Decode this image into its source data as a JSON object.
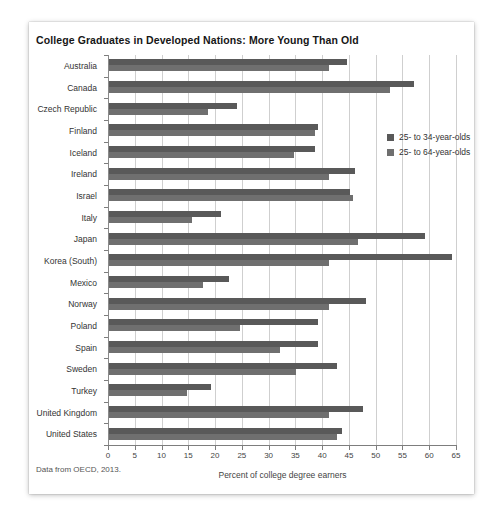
{
  "chart_data": {
    "type": "bar",
    "orientation": "horizontal",
    "title": "College Graduates in Developed Nations: More Young Than Old",
    "xlabel": "Percent of college degree earners",
    "ylabel": "",
    "xlim": [
      0,
      65
    ],
    "xticks": [
      0,
      5,
      10,
      15,
      20,
      25,
      30,
      35,
      40,
      45,
      50,
      55,
      60,
      65
    ],
    "grid": true,
    "legend_position": "upper right",
    "source_note": "Data from OECD, 2013.",
    "categories": [
      "Australia",
      "Canada",
      "Czech Republic",
      "Finland",
      "Iceland",
      "Ireland",
      "Israel",
      "Italy",
      "Japan",
      "Korea (South)",
      "Mexico",
      "Norway",
      "Poland",
      "Spain",
      "Sweden",
      "Turkey",
      "United Kingdom",
      "United States"
    ],
    "series": [
      {
        "name": "25- to 34-year-olds",
        "color": "#595959",
        "values": [
          44.5,
          57,
          24,
          39,
          38.5,
          46,
          45,
          21,
          59,
          64,
          22.5,
          48,
          39,
          39,
          42.5,
          19,
          47.5,
          43.5
        ]
      },
      {
        "name": "25- to 64-year-olds",
        "color": "#6f6f6f",
        "values": [
          41,
          52.5,
          18.5,
          38.5,
          34.5,
          41,
          45.5,
          15.5,
          46.5,
          41,
          17.5,
          41,
          24.5,
          32,
          35,
          14.5,
          41,
          42.5
        ]
      }
    ]
  }
}
